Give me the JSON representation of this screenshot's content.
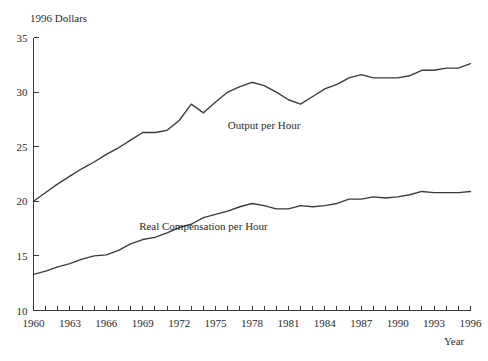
{
  "chart_data": {
    "type": "line",
    "title": "",
    "ylabel": "1996 Dollars",
    "xlabel": "Year",
    "xlim": [
      1960,
      1996
    ],
    "ylim": [
      10,
      35
    ],
    "grid": false,
    "legend_position": "inline-annotation",
    "y_ticks": [
      10,
      15,
      20,
      25,
      30,
      35
    ],
    "y_tick_labels": [
      "10",
      "15",
      "20",
      "25",
      "30",
      "35"
    ],
    "x_tick_labels": [
      "1960",
      "1963",
      "1966",
      "1969",
      "1972",
      "1975",
      "1978",
      "1981",
      "1984",
      "1987",
      "1990",
      "1993",
      "1996"
    ],
    "x_tick_label_values": [
      1960,
      1963,
      1966,
      1969,
      1972,
      1975,
      1978,
      1981,
      1984,
      1987,
      1990,
      1993,
      1996
    ],
    "x_minor_tick_step": 1,
    "x": [
      1960,
      1961,
      1962,
      1963,
      1964,
      1965,
      1966,
      1967,
      1968,
      1969,
      1970,
      1971,
      1972,
      1973,
      1974,
      1975,
      1976,
      1977,
      1978,
      1979,
      1980,
      1981,
      1982,
      1983,
      1984,
      1985,
      1986,
      1987,
      1988,
      1989,
      1990,
      1991,
      1992,
      1993,
      1994,
      1995,
      1996
    ],
    "series": [
      {
        "name": "Output per Hour",
        "color": "#3a3a3a",
        "label_x": 1979.0,
        "label_y": 26.6,
        "values": [
          20.0,
          20.8,
          21.6,
          22.3,
          23.0,
          23.6,
          24.3,
          24.9,
          25.6,
          26.3,
          26.3,
          26.5,
          27.4,
          28.9,
          28.1,
          29.1,
          30.0,
          30.5,
          30.9,
          30.6,
          30.0,
          29.3,
          28.9,
          29.6,
          30.3,
          30.7,
          31.3,
          31.6,
          31.3,
          31.3,
          31.3,
          31.5,
          32.0,
          32.0,
          32.2,
          32.2,
          32.6
        ]
      },
      {
        "name": "Real Compensation per Hour",
        "color": "#3a3a3a",
        "label_x": 1974.0,
        "label_y": 17.4,
        "values": [
          13.3,
          13.6,
          14.0,
          14.3,
          14.7,
          15.0,
          15.1,
          15.5,
          16.1,
          16.5,
          16.7,
          17.1,
          17.6,
          17.9,
          18.5,
          18.8,
          19.1,
          19.5,
          19.8,
          19.6,
          19.3,
          19.3,
          19.6,
          19.5,
          19.6,
          19.8,
          20.2,
          20.2,
          20.4,
          20.3,
          20.4,
          20.6,
          20.9,
          20.8,
          20.8,
          20.8,
          20.9
        ]
      }
    ]
  }
}
